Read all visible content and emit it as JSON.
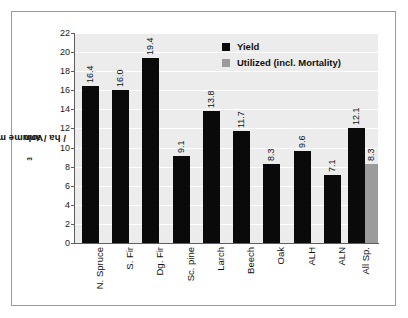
{
  "chart_data": {
    "type": "bar",
    "title": "",
    "subtitle": "",
    "xlabel": "",
    "ylabel": "Volume m³ / ha / ann",
    "ylabel_base": "Volume m",
    "ylabel_sup": "3",
    "ylabel_tail": " / ha / ann",
    "ylim": [
      0,
      22
    ],
    "yticks": [
      0,
      2,
      4,
      6,
      8,
      10,
      12,
      14,
      16,
      18,
      20,
      22
    ],
    "ytick_labels": [
      "0",
      "2",
      "4",
      "6",
      "8",
      "10",
      "12",
      "14",
      "16",
      "18",
      "20",
      "22"
    ],
    "grid": "horizontal",
    "legend_position": "top-right",
    "categories": [
      "N. Spruce",
      "S. Fir",
      "Dg. Fir",
      "Sc. pine",
      "Larch",
      "Beech",
      "Oak",
      "ALH",
      "ALN",
      "All Sp."
    ],
    "series": [
      {
        "name": "Yield",
        "color": "#0a0a0a",
        "values": [
          16.4,
          16.0,
          19.4,
          9.1,
          13.8,
          11.7,
          8.3,
          9.6,
          7.1,
          12.1
        ],
        "labels": [
          "16.4",
          "16.0",
          "19.4",
          "9.1",
          "13.8",
          "11.7",
          "8.3",
          "9.6",
          "7.1",
          "12.1"
        ]
      },
      {
        "name": "Utilized (incl. Mortality)",
        "color": "#9b9b9b",
        "values": [
          null,
          null,
          null,
          null,
          null,
          null,
          null,
          null,
          null,
          8.3
        ],
        "labels": [
          "",
          "",
          "",
          "",
          "",
          "",
          "",
          "",
          "",
          "8.3"
        ]
      }
    ],
    "plot_background": "#ececec",
    "gridline_color": "#ffffff",
    "axis_color": "#5f5f5f",
    "frame_color": "#9a9a9a"
  },
  "legend": {
    "items": [
      {
        "label": "Yield",
        "color": "#0a0a0a"
      },
      {
        "label": "Utilized (incl. Mortality)",
        "color": "#9b9b9b"
      }
    ]
  }
}
